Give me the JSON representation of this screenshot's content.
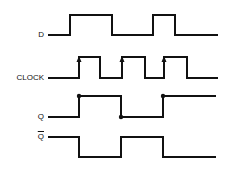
{
  "diagram": {
    "signals": [
      {
        "name": "D",
        "label": "D",
        "y_high": 15,
        "y_low": 35,
        "points": "48,35 70,35 70,15 112,15 112,35 153,35 153,15 175,15 175,35 218,35"
      },
      {
        "name": "CLOCK",
        "label": "CLOCK",
        "y_high": 57,
        "y_low": 78,
        "points": "48,78 79,78 79,57 100,57 100,78 122,78 122,57 145,57 145,78 164,78 164,57 187,57 187,78 218,78",
        "rising_edge_arrows": [
          79,
          122,
          164
        ]
      },
      {
        "name": "Q",
        "label": "Q",
        "y_high": 96,
        "y_low": 117,
        "points": "48,117 79,117 79,96 121,96 121,117 163,117 163,96 216,96",
        "dots": [
          [
            79,
            96
          ],
          [
            121,
            117
          ],
          [
            163,
            96
          ]
        ]
      },
      {
        "name": "Q_bar",
        "label": "Q",
        "overline": true,
        "y_high": 137,
        "y_low": 157,
        "points": "48,137 79,137 79,157 121,157 121,137 163,137 163,157 216,157"
      }
    ],
    "colors": {
      "line": "#111111",
      "background": "#ffffff"
    }
  }
}
